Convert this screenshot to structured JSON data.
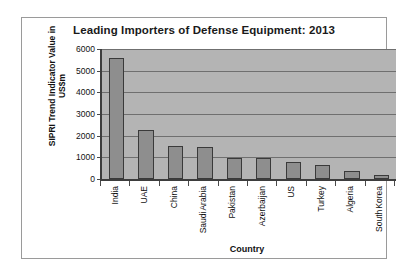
{
  "chart_data": {
    "type": "bar",
    "title": "Leading Importers of Defense Equipment: 2013",
    "xlabel": "Country",
    "ylabel": "SIPRI Trend Indicator Value in US$m",
    "ylabel_lines": [
      "SIPRI Trend Indicator Value in",
      "US$m"
    ],
    "categories": [
      "India",
      "UAE",
      "China",
      "Saudi Arabia",
      "Pakistan",
      "Azerbaijan",
      "US",
      "Turkey",
      "Algeria",
      "South Korea"
    ],
    "category_lines": [
      [
        "India"
      ],
      [
        "UAE"
      ],
      [
        "China"
      ],
      [
        "Saudi",
        "Arabia"
      ],
      [
        "Pakistan"
      ],
      [
        "Azerbaijan"
      ],
      [
        "US"
      ],
      [
        "Turkey"
      ],
      [
        "Algeria"
      ],
      [
        "South",
        "Korea"
      ]
    ],
    "values": [
      5570,
      2240,
      1530,
      1500,
      990,
      960,
      770,
      640,
      380,
      200
    ],
    "ylim": [
      0,
      6000
    ],
    "yticks": [
      0,
      1000,
      2000,
      3000,
      4000,
      5000,
      6000
    ],
    "ytick_labels": [
      "0",
      "1000",
      "2000",
      "3000",
      "4000",
      "5000",
      "6000"
    ],
    "grid": true,
    "legend": false,
    "colors": {
      "bar_fill": "#8e8e8e",
      "bar_border": "#3a3a3a",
      "plot_background": "#b4b4b4",
      "gridline": "#6f6f6f",
      "axis": "#3d3d3d",
      "text": "#111111",
      "frame": "#9a9a9a",
      "page_background": "#ffffff"
    }
  }
}
